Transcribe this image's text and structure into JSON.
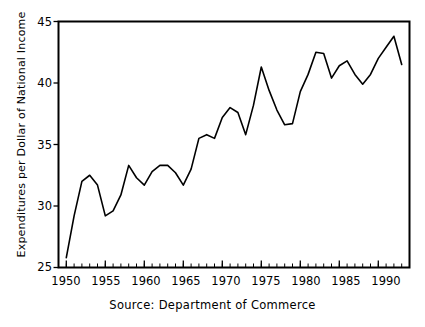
{
  "chart_data": {
    "type": "line",
    "title": "",
    "subtitle": "",
    "xlabel": "",
    "ylabel": "Expenditures per Dollar of National Income",
    "caption": "Source: Department of Commerce",
    "annotation": "The average since 1950 is $.36 of government expenditures\nper dollar of income. The high was $.44 in 1992\nwhile the low was $.26 in 1950.",
    "xlim": [
      1949,
      1994
    ],
    "ylim": [
      25,
      45
    ],
    "ytick_labels": [
      "25",
      "30",
      "35",
      "40",
      "45"
    ],
    "yticks": [
      25,
      30,
      35,
      40,
      45
    ],
    "xtick_labels": [
      "1950",
      "1955",
      "1960",
      "1965",
      "1970",
      "1975",
      "1980",
      "1985",
      "1990"
    ],
    "xticks": [
      1950,
      1955,
      1960,
      1965,
      1970,
      1975,
      1980,
      1985,
      1990
    ],
    "minor_xtick_interval": 1,
    "grid": false,
    "legend": "none",
    "line_color": "#000000",
    "axis_color": "#000000",
    "background": "#ffffff",
    "x": [
      1950,
      1951,
      1952,
      1953,
      1954,
      1955,
      1956,
      1957,
      1958,
      1959,
      1960,
      1961,
      1962,
      1963,
      1964,
      1965,
      1966,
      1967,
      1968,
      1969,
      1970,
      1971,
      1972,
      1973,
      1974,
      1975,
      1976,
      1977,
      1978,
      1979,
      1980,
      1981,
      1982,
      1983,
      1984,
      1985,
      1986,
      1987,
      1988,
      1989,
      1990,
      1991,
      1992,
      1993
    ],
    "values": [
      25.8,
      29.2,
      32.0,
      32.5,
      31.7,
      29.2,
      29.6,
      30.9,
      33.3,
      32.3,
      31.7,
      32.8,
      33.3,
      33.3,
      32.7,
      31.7,
      33.0,
      35.5,
      35.8,
      35.5,
      37.2,
      38.0,
      37.6,
      35.8,
      38.2,
      41.3,
      39.4,
      37.8,
      36.6,
      36.7,
      39.3,
      40.7,
      42.5,
      42.4,
      40.4,
      41.4,
      41.8,
      40.7,
      39.9,
      40.7,
      42.0,
      42.9,
      43.8,
      41.5
    ],
    "series_name": "Government expenditures per dollar of national income",
    "average": 0.36,
    "high": {
      "value": 0.44,
      "year": 1992
    },
    "low": {
      "value": 0.26,
      "year": 1950
    }
  }
}
